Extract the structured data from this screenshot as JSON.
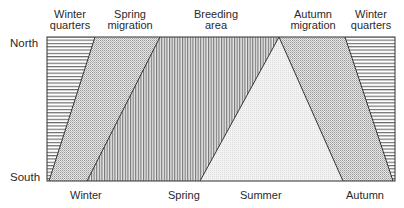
{
  "diagram": {
    "y_axis": {
      "top_label": "North",
      "bottom_label": "South"
    },
    "top_labels": [
      {
        "id": "winter-quarters-left",
        "line1": "Winter",
        "line2": "quarters"
      },
      {
        "id": "spring-migration",
        "line1": "Spring",
        "line2": "migration"
      },
      {
        "id": "breeding-area",
        "line1": "Breeding",
        "line2": "area"
      },
      {
        "id": "autumn-migration",
        "line1": "Autumn",
        "line2": "migration"
      },
      {
        "id": "winter-quarters-right",
        "line1": "Winter",
        "line2": "quarters"
      }
    ],
    "bottom_labels": [
      "Winter",
      "Spring",
      "Summer",
      "Autumn"
    ],
    "regions": [
      {
        "name": "Winter quarters (left)",
        "pattern": "horizontal-lines"
      },
      {
        "name": "Spring migration",
        "pattern": "dots"
      },
      {
        "name": "Breeding area",
        "pattern": "vertical-lines"
      },
      {
        "name": "Summer (triangle)",
        "pattern": "light-stipple"
      },
      {
        "name": "Autumn migration",
        "pattern": "dots"
      },
      {
        "name": "Winter quarters (right)",
        "pattern": "horizontal-lines"
      }
    ],
    "colors": {
      "line": "#333333",
      "hatch": "#555555",
      "dots": "#8a8a8a",
      "light": "#d8d8d8"
    }
  }
}
